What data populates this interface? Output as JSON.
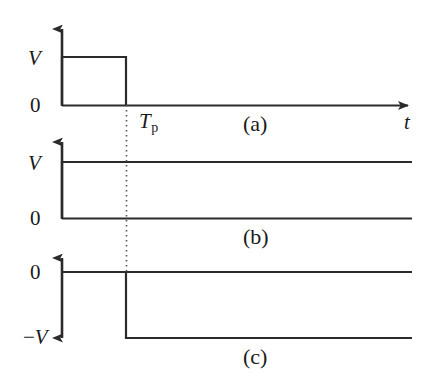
{
  "figure": {
    "stroke_color": "#2b2b2b",
    "background_color": "#ffffff"
  },
  "axes": {
    "time_axis_label": "t",
    "pulse_width_label": "T",
    "pulse_width_subscript": "p"
  },
  "panels": [
    {
      "tag": "(a)",
      "y_labels": [
        {
          "text": "V",
          "kind": "italic"
        },
        {
          "text": "0",
          "kind": "roman"
        }
      ],
      "signal": "rectangular pulse of amplitude V for 0 < t < Tp, zero elsewhere"
    },
    {
      "tag": "(b)",
      "y_labels": [
        {
          "text": "V",
          "kind": "italic"
        },
        {
          "text": "0",
          "kind": "roman"
        }
      ],
      "signal": "unit step rising from 0 to V at t = 0 and remaining at V"
    },
    {
      "tag": "(c)",
      "y_labels": [
        {
          "text": "0",
          "kind": "roman"
        },
        {
          "text": "−V",
          "kind": "italic-neg"
        }
      ],
      "signal": "step remaining at 0 until t = Tp then dropping to −V"
    }
  ],
  "chart_data": {
    "type": "line",
    "title": "",
    "xlabel": "t",
    "ylabel": "",
    "grid": false,
    "legend": null,
    "annotations": [
      "(a)",
      "(b)",
      "(c)",
      "T_p"
    ],
    "shared_x_markers": [
      {
        "label": "0",
        "value": 0
      },
      {
        "label": "T_p",
        "value": 1
      }
    ],
    "subplots": [
      {
        "tag": "(a)",
        "ylim_labels": [
          "0",
          "V"
        ],
        "x": [
          0,
          0,
          1,
          1,
          4
        ],
        "y": [
          0,
          1,
          1,
          0,
          0
        ],
        "ytick_values": [
          0,
          1
        ],
        "ytick_labels": [
          "0",
          "V"
        ]
      },
      {
        "tag": "(b)",
        "ylim_labels": [
          "0",
          "V"
        ],
        "x": [
          0,
          0,
          4
        ],
        "y": [
          0,
          1,
          1
        ],
        "ytick_values": [
          0,
          1
        ],
        "ytick_labels": [
          "0",
          "V"
        ]
      },
      {
        "tag": "(c)",
        "ylim_labels": [
          "-V",
          "0"
        ],
        "x": [
          0,
          1,
          1,
          4
        ],
        "y": [
          0,
          0,
          -1,
          -1
        ],
        "ytick_values": [
          -1,
          0
        ],
        "ytick_labels": [
          "−V",
          "0"
        ]
      }
    ]
  }
}
